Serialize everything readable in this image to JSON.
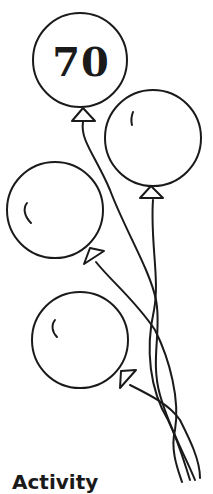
{
  "illustration": {
    "balloon_number": "70",
    "balloon_count": 4,
    "line_color": "#1a1a1a",
    "background": "#ffffff"
  },
  "heading": "Activity"
}
